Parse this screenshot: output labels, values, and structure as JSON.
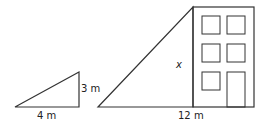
{
  "diagram": {
    "small_triangle": {
      "base_label": "4 m",
      "height_label": "3 m"
    },
    "large_triangle": {
      "base_label": "12 m",
      "height_label": "x"
    },
    "building": {
      "windows": 5,
      "door": 1
    },
    "colors": {
      "stroke": "#333333",
      "background": "#ffffff"
    }
  }
}
